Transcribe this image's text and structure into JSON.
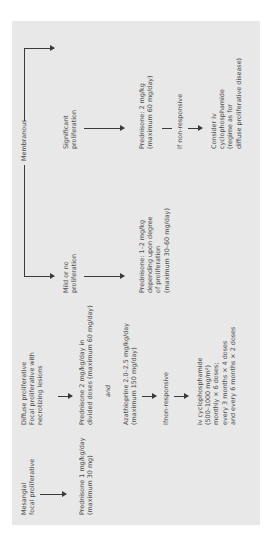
{
  "diagram": {
    "columns": {
      "mesangial": {
        "header": [
          "Mesangial",
          "focal proliferative"
        ],
        "treatment": [
          "Prednisone 1 mg/kg/day",
          "(maximum 30 mg)"
        ]
      },
      "diffuse": {
        "header": [
          "Diffuse proliferative",
          "Focal proliferative with",
          "necrotizing lesions"
        ],
        "prednisone": [
          "Prednisone 2 mg/kg/day in",
          "divided doses (maximum 60 mg/day)"
        ],
        "and": "and",
        "azathioprine": [
          "Azathioprine 2.0–2.5 mg/kg/day",
          "(maximum 150 mg/day)"
        ],
        "non_responsive": "Ifnon-responsive",
        "cyclophosphamide": [
          "iv cyclophosphamide",
          "(500–1000 mg/m²)",
          "monthly × 6 doses;",
          "every 3 months × 4 doses",
          "and every 6 months × 2 doses"
        ]
      },
      "membranous": {
        "header": "Membranous",
        "mild": {
          "label": [
            "Mild or no",
            "proliferation"
          ],
          "treatment": [
            "Prednisone: 1–2 mg/kg",
            "depending upon degree",
            "of proliferation",
            "(maximum 30–60 mg/day)"
          ]
        },
        "significant": {
          "label": [
            "Significant",
            "proliferation"
          ],
          "treatment": [
            "Prednisone: 2 mg/kg",
            "(maximum 60 mg/day)"
          ],
          "non_responsive": "If non-responsive",
          "next": [
            "Consider iv",
            "cyclophosphamide",
            "(regime as for",
            "diffuse proliferative disease)"
          ]
        }
      }
    },
    "colors": {
      "panel_bg": "#e8e8e8",
      "text": "#4a4a4a",
      "lines": "#3a3a3a"
    }
  }
}
